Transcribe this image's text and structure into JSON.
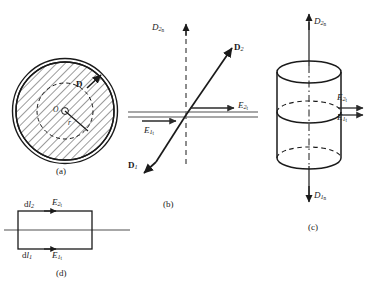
{
  "figure": {
    "panels": [
      {
        "id": "a",
        "caption": "(a)",
        "description": "Hatched circular cross-section with inner dashed circle, center O, radius r and flux density vector D",
        "labels": {
          "center": "O",
          "radius": "r",
          "vector": "D"
        }
      },
      {
        "id": "b",
        "caption": "(b)",
        "description": "Refraction of D at an interface showing tangential E components",
        "labels": {
          "normal_axis": "D2n",
          "vector_incident": "D1",
          "vector_refracted": "D2",
          "tangential_1": "E1t",
          "tangential_2": "E2t"
        }
      },
      {
        "id": "c",
        "caption": "(c)",
        "description": "Gaussian pillbox cylinder straddling the interface",
        "labels": {
          "normal_up": "D2n",
          "normal_down": "D1n",
          "tangential_2": "E2t",
          "tangential_1": "E1t"
        }
      },
      {
        "id": "d",
        "caption": "(d)",
        "description": "Amperian rectangular loop straddling the interface",
        "labels": {
          "dl_top": "dl2",
          "dl_bottom": "dl1",
          "tangential_2": "E2t",
          "tangential_1": "E1t"
        }
      }
    ]
  },
  "colors": {
    "ink": "#1a1a1a",
    "line": "#2b2b2b",
    "interface": "#8a8a8a",
    "hatch": "#3a3a3a",
    "background": "#ffffff"
  }
}
